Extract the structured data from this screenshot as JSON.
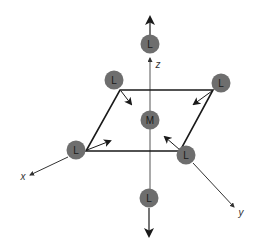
{
  "diagram": {
    "type": "octahedral-complex-distortion",
    "colors": {
      "atom_fill": "#6e6e6e",
      "line": "#1a1a1a",
      "axis": "#333333",
      "background": "#ffffff"
    },
    "metal": {
      "label": "M"
    },
    "ligands": [
      {
        "id": "top",
        "label": "L"
      },
      {
        "id": "upper-left",
        "label": "L"
      },
      {
        "id": "upper-right",
        "label": "L"
      },
      {
        "id": "lower-left",
        "label": "L"
      },
      {
        "id": "lower-right",
        "label": "L"
      },
      {
        "id": "bottom",
        "label": "L"
      }
    ],
    "axes": {
      "x": "x",
      "y": "y",
      "z": "z"
    }
  }
}
